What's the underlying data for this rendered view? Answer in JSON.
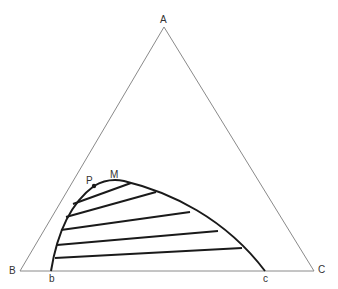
{
  "diagram": {
    "type": "ternary-phase-diagram",
    "vertices": {
      "A": {
        "label": "A",
        "x": 164,
        "y": 27
      },
      "B": {
        "label": "B",
        "x": 20,
        "y": 271
      },
      "C": {
        "label": "C",
        "x": 314,
        "y": 271
      }
    },
    "points": {
      "b": {
        "label": "b",
        "x": 51,
        "y": 271
      },
      "c": {
        "label": "c",
        "x": 265,
        "y": 271
      },
      "P": {
        "label": "P",
        "x": 94,
        "y": 186
      },
      "M": {
        "label": "M",
        "x": 118,
        "y": 181
      }
    },
    "tie_lines": [
      {
        "x1": 73,
        "y1": 204,
        "x2": 131,
        "y2": 183
      },
      {
        "x1": 66,
        "y1": 217,
        "x2": 156,
        "y2": 192
      },
      {
        "x1": 61,
        "y1": 230,
        "x2": 190,
        "y2": 212
      },
      {
        "x1": 57,
        "y1": 245,
        "x2": 218,
        "y2": 231
      },
      {
        "x1": 55,
        "y1": 258,
        "x2": 240,
        "y2": 248
      }
    ],
    "colors": {
      "triangle": "#8a8a8a",
      "curve": "#1a1a1a",
      "label": "#333333"
    }
  }
}
